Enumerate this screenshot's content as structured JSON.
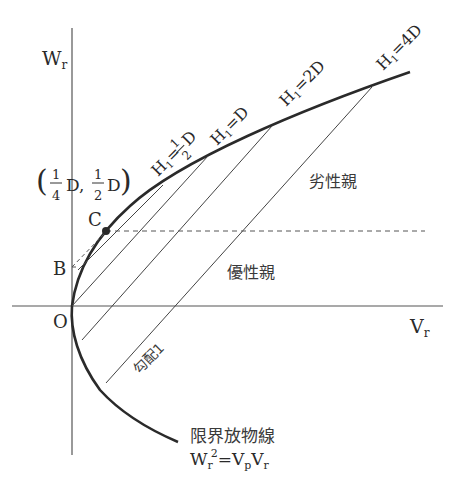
{
  "diagram": {
    "type": "Wr-Vr graph",
    "axes": {
      "x_label": "V",
      "x_label_sub": "r",
      "y_label": "W",
      "y_label_sub": "r",
      "origin_label": "O"
    },
    "points": {
      "B": "B",
      "C": "C",
      "coord_label": {
        "open": "(",
        "frac1_num": "1",
        "frac1_den": "4",
        "d1": "D,",
        "frac2_num": "1",
        "frac2_den": "2",
        "d2": "D",
        "close": ")"
      }
    },
    "lines": [
      {
        "label_main": "H",
        "label_sub": "1",
        "label_eq": "=",
        "label_val": "D",
        "frac_num": "1",
        "frac_den": "2",
        "name": "H1=1/2D"
      },
      {
        "label_main": "H",
        "label_sub": "1",
        "label_eq": "=",
        "label_val": "D",
        "name": "H1=D"
      },
      {
        "label_main": "H",
        "label_sub": "1",
        "label_eq": "=",
        "label_val": "2D",
        "name": "H1=2D"
      },
      {
        "label_main": "H",
        "label_sub": "1",
        "label_eq": "=",
        "label_val": "4D",
        "name": "H1=4D"
      }
    ],
    "regions": {
      "recessive": "劣性親",
      "dominant": "優性親"
    },
    "slope_label": "勾配1",
    "parabola": {
      "name": "限界放物線",
      "eq_w": "W",
      "eq_w_sub": "r",
      "eq_w_sup": "2",
      "eq_rest": "=V",
      "eq_p": "p",
      "eq_v": "V",
      "eq_r": "r"
    }
  }
}
